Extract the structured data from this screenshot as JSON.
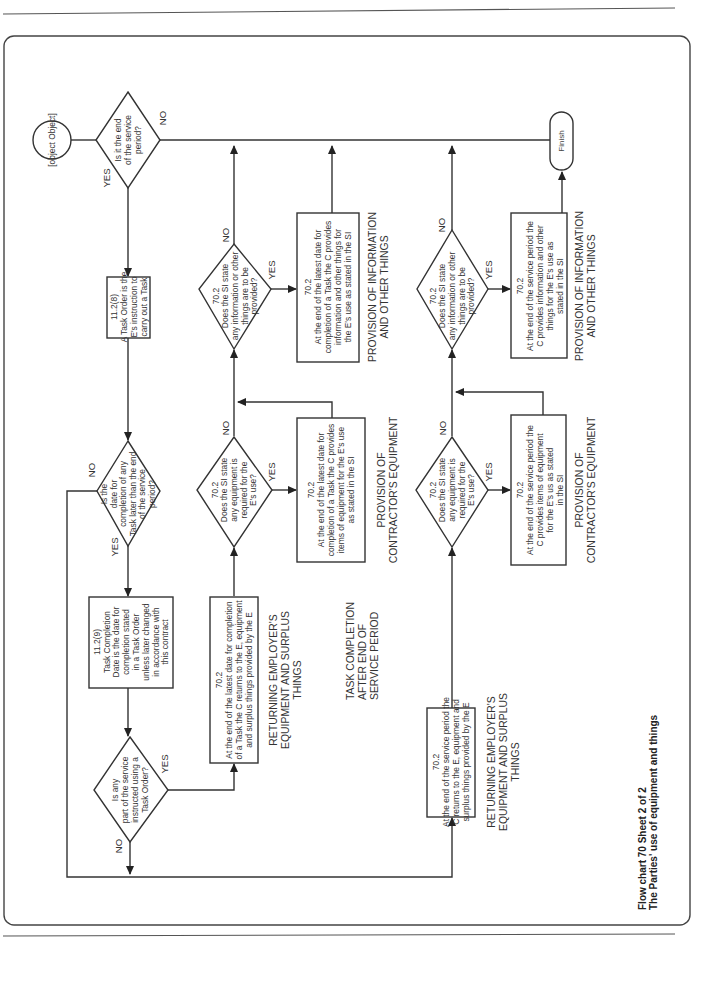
{
  "caption": {
    "line1": "Flow chart 70 Sheet 2 of 2",
    "line2": "The Parties' use of equipment and things"
  },
  "connector": {
    "line1": "A",
    "line2": "Sheet 1"
  },
  "finish": "Finish",
  "labels": {
    "yes": "YES",
    "no": "NO"
  },
  "nodes": {
    "d_end_service": [
      "Is it the end",
      "of the service",
      "period?"
    ],
    "b_11_2_8": [
      "11.2(8)",
      "A Task Order is the",
      "E's instruction to",
      "carry out a Task"
    ],
    "d_date_later": [
      "Is the",
      "date for",
      "completion of any",
      "Task later than the end",
      "of the service",
      "period?"
    ],
    "b_11_2_9": [
      "11.2(9)",
      "Task Completion",
      "Date is the date for",
      "completion stated",
      "in a Task Order",
      "unless later changed",
      "in accordance with",
      "this contract"
    ],
    "d_any_part": [
      "Is any",
      "part of the service",
      "instructed using a",
      "Task Order?"
    ],
    "b_return_task": [
      "70.2",
      "At the end of the latest date for completion",
      "of a Task the C returns to the E, equipment",
      "and surplus things provided by the E"
    ],
    "d_equip_task": [
      "70.2",
      "Does the SI state",
      "any equipment is",
      "required for the",
      "E's use?"
    ],
    "b_equip_task": [
      "70.2",
      "At the end of the latest date for",
      "completion of a Task the C provides",
      "items of equipment for the E's use",
      "as stated in the SI"
    ],
    "d_info_task": [
      "70.2",
      "Does the SI state",
      "any information or other",
      "things are to be",
      "provided?"
    ],
    "b_info_task": [
      "70.2",
      "At the end of the latest date for",
      "completion of a Task  the C provides",
      "information and other things for",
      "the E's use as stated in the SI"
    ],
    "b_return_period": [
      "70.2",
      "At the end of the service period the",
      "C returns to the E, equipment and",
      "surplus things provided by the E"
    ],
    "d_equip_period": [
      "70.2",
      "Does the SI state",
      "any equipment is",
      "required for the",
      "E's use?"
    ],
    "b_equip_period": [
      "70.2",
      "At the end of the service period the",
      "C provides items of equipment",
      "for the E's us as stated",
      "in the SI"
    ],
    "d_info_period": [
      "70.2",
      "Does the SI state",
      "any information or other",
      "things are to be",
      "provided?"
    ],
    "b_info_period": [
      "70.2",
      "At the end of the service period the",
      "C provides information and other",
      "things for the E's use as",
      "stated in the SI"
    ]
  },
  "headings": {
    "returning_task": [
      "RETURNING EMPLOYER'S",
      "EQUIPMENT AND SURPLUS",
      "THINGS"
    ],
    "provision_equip_task": [
      "PROVISION OF",
      "CONTRACTOR'S EQUIPMENT"
    ],
    "provision_info_task": [
      "PROVISION OF INFORMATION",
      "AND OTHER THINGS"
    ],
    "task_completion_after": [
      "TASK COMPLETION",
      "AFTER END OF",
      "SERVICE PERIOD"
    ],
    "returning_period": [
      "RETURNING EMPLOYER'S",
      "EQUIPMENT AND SURPLUS",
      "THINGS"
    ],
    "provision_equip_period": [
      "PROVISION OF",
      "CONTRACTOR'S EQUIPMENT"
    ],
    "provision_info_period": [
      "PROVISION OF INFORMATION",
      "AND OTHER THINGS"
    ]
  }
}
